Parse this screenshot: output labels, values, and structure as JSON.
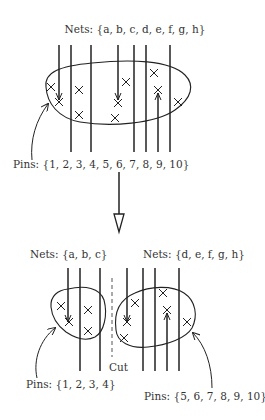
{
  "top": {
    "nets_label": "Nets: {a, b, c, d, e, f, g, h}",
    "pins_label": "Pins: {1, 2, 3, 4, 5, 6, 7, 8, 9, 10}"
  },
  "bottom": {
    "left_nets_label": "Nets: {a, b, c}",
    "right_nets_label": "Nets: {d, e, f, g, h}",
    "cut_label": "Cut",
    "left_pins_label": "Pins: {1, 2, 3, 4}",
    "right_pins_label": "Pins: {5, 6, 7, 8, 9, 10}"
  },
  "colors": {
    "stroke": "#222222",
    "text": "#333333",
    "background": "#ffffff"
  }
}
